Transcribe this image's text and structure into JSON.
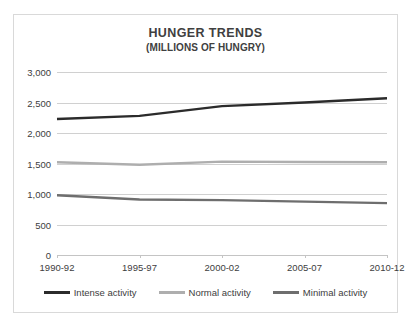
{
  "chart_data": {
    "type": "line",
    "title": "HUNGER TRENDS",
    "subtitle": "(MILLIONS OF HUNGRY)",
    "xlabel": "",
    "ylabel": "",
    "categories": [
      "1990-92",
      "1995-97",
      "2000-02",
      "2005-07",
      "2010-12"
    ],
    "series": [
      {
        "name": "Intense activity",
        "color": "#2b2b2b",
        "values": [
          2230,
          2280,
          2440,
          2500,
          2570
        ]
      },
      {
        "name": "Normal activity",
        "color": "#aeaeae",
        "values": [
          1520,
          1480,
          1530,
          1525,
          1520
        ]
      },
      {
        "name": "Minimal activity",
        "color": "#6e6e6e",
        "values": [
          980,
          910,
          900,
          875,
          850
        ]
      }
    ],
    "ylim": [
      0,
      3000
    ],
    "yticks": [
      0,
      500,
      1000,
      1500,
      2000,
      2500,
      3000
    ],
    "ytick_labels": [
      "0",
      "500",
      "1,000",
      "1,500",
      "2,000",
      "2,500",
      "3,000"
    ],
    "grid": true,
    "legend_position": "bottom",
    "markers": false
  },
  "legend": {
    "items": [
      {
        "label": "Intense activity",
        "color": "#2b2b2b"
      },
      {
        "label": "Normal activity",
        "color": "#aeaeae"
      },
      {
        "label": "Minimal activity",
        "color": "#6e6e6e"
      }
    ]
  },
  "colors": {
    "border": "#d9d9d9",
    "gridline": "#d0d0d0",
    "text": "#404040",
    "background": "#ffffff"
  }
}
